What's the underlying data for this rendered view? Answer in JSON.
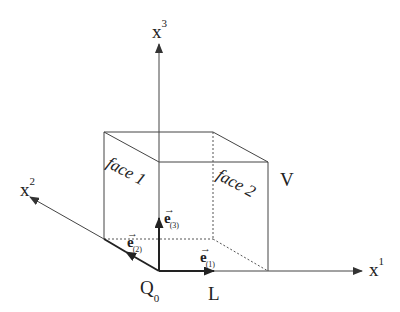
{
  "diagram": {
    "axes": {
      "x1": {
        "label": "x",
        "superscript": "1"
      },
      "x2": {
        "label": "x",
        "superscript": "2"
      },
      "x3": {
        "label": "x",
        "superscript": "3"
      }
    },
    "faces": {
      "face1": "face 1",
      "face2": "face 2"
    },
    "volume_label": "V",
    "length_label": "L",
    "origin": {
      "label": "Q",
      "subscript": "0"
    },
    "basis_vectors": {
      "e1": {
        "label": "e",
        "subscript": "(1)"
      },
      "e2": {
        "label": "e",
        "subscript": "(2)"
      },
      "e3": {
        "label": "e",
        "subscript": "(3)"
      }
    },
    "colors": {
      "line": "#333333",
      "background": "#ffffff"
    }
  }
}
